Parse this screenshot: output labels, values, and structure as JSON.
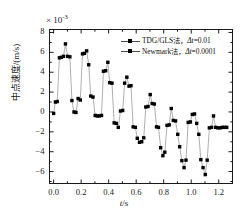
{
  "chart_data": {
    "type": "line",
    "title": "",
    "xlabel": "t/s",
    "ylabel": "中点速度/(m/s)",
    "y_exponent_text": "× 10",
    "y_exponent_power": "-3",
    "xlim": [
      -0.03,
      1.3
    ],
    "ylim": [
      -7.2,
      8.3
    ],
    "xticks": [
      "0.0",
      "0.2",
      "0.4",
      "0.6",
      "0.8",
      "1.0",
      "1.2"
    ],
    "xtick_values": [
      0.0,
      0.2,
      0.4,
      0.6,
      0.8,
      1.0,
      1.2
    ],
    "yticks": [
      "8",
      "6",
      "4",
      "2",
      "0",
      "-2",
      "-4",
      "-6"
    ],
    "ytick_values": [
      8,
      6,
      4,
      2,
      0,
      -2,
      -4,
      -6
    ],
    "grid": false,
    "legend_position": "upper-right",
    "series": [
      {
        "name": "TDG/GLS法，Δt=0.01",
        "marker": "square",
        "line": true,
        "color": "#000000",
        "x": [
          0.0,
          0.013,
          0.026,
          0.042,
          0.056,
          0.072,
          0.086,
          0.102,
          0.118,
          0.133,
          0.148,
          0.162,
          0.178,
          0.194,
          0.21,
          0.224,
          0.24,
          0.255,
          0.27,
          0.286,
          0.302,
          0.316,
          0.332,
          0.348,
          0.362,
          0.378,
          0.394,
          0.408,
          0.424,
          0.44,
          0.455,
          0.47,
          0.486,
          0.502,
          0.516,
          0.532,
          0.548,
          0.562,
          0.578,
          0.594,
          0.608,
          0.624,
          0.64,
          0.655,
          0.67,
          0.686,
          0.702,
          0.716,
          0.732,
          0.748,
          0.762,
          0.778,
          0.794,
          0.808,
          0.824,
          0.84,
          0.855,
          0.87,
          0.886,
          0.902,
          0.916,
          0.932,
          0.948,
          0.962,
          0.978,
          0.994,
          1.008,
          1.024,
          1.04,
          1.055,
          1.07,
          1.086,
          1.102,
          1.116,
          1.132,
          1.148,
          1.162,
          1.178,
          1.194,
          1.21,
          1.226,
          1.242,
          1.258
        ],
        "y": [
          -0.15,
          1.0,
          1.05,
          5.45,
          5.5,
          5.6,
          6.85,
          5.6,
          5.55,
          1.15,
          0.0,
          -0.05,
          1.35,
          1.2,
          5.85,
          5.9,
          6.15,
          4.75,
          1.6,
          1.5,
          -0.35,
          -0.4,
          -0.4,
          -0.35,
          4.1,
          4.15,
          5.0,
          2.95,
          2.9,
          -1.1,
          -1.15,
          -1.55,
          0.1,
          0.15,
          2.9,
          3.5,
          2.6,
          2.65,
          -1.5,
          -1.55,
          -2.65,
          -3.05,
          -3.0,
          -2.6,
          0.5,
          0.55,
          1.75,
          0.85,
          0.8,
          -1.5,
          -1.55,
          -3.6,
          -4.4,
          -4.05,
          -1.35,
          -1.3,
          0.35,
          -0.85,
          -0.9,
          -2.25,
          -3.5,
          -4.9,
          -5.6,
          -4.85,
          -1.05,
          -1.0,
          -0.25,
          -0.2,
          -1.15,
          -2.25,
          -4.8,
          -5.6,
          -6.3,
          -4.85,
          -1.6,
          -1.55,
          -0.4,
          -1.55,
          -1.6,
          -1.6,
          -1.55,
          -1.55,
          -1.55
        ]
      },
      {
        "name": "Newmark法，Δt=0.0001",
        "marker": "circle",
        "line": false,
        "color": "#000000"
      }
    ]
  },
  "legend": {
    "items": [
      {
        "label_main": "TDG/GLS法，",
        "label_delta": "Δ",
        "label_var": "t",
        "label_val": "=0.01"
      },
      {
        "label_main": "Newmark法，",
        "label_delta": "Δ",
        "label_var": "t",
        "label_val": "=0.0001"
      }
    ]
  },
  "axes": {
    "x_axis_title": "t/s",
    "x_axis_var": "t",
    "x_axis_unit": "/s",
    "y_axis_title": "中点速度/(m/s)"
  }
}
